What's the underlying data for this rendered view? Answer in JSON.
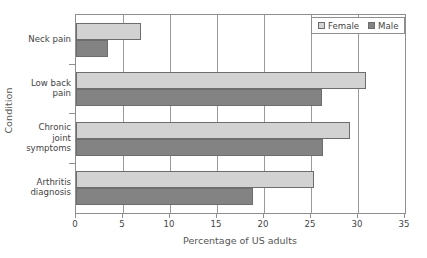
{
  "chart_data": {
    "type": "bar",
    "orientation": "horizontal",
    "title": "",
    "xlabel": "Percentage of US adults",
    "ylabel": "Condition",
    "xlim": [
      0,
      35
    ],
    "xticks": [
      0,
      5,
      10,
      15,
      20,
      25,
      30,
      35
    ],
    "grid": true,
    "legend_position": "top-right",
    "categories": [
      "Neck pain",
      "Low back pain",
      "Chronic joint symptoms",
      "Arthritis diagnosis"
    ],
    "category_lines": [
      [
        "Neck pain"
      ],
      [
        "Low back",
        "pain"
      ],
      [
        "Chronic",
        "joint",
        "symptoms"
      ],
      [
        "Arthritis",
        "diagnosis"
      ]
    ],
    "series": [
      {
        "name": "Female",
        "color": "#d2d2d2",
        "values": [
          6.9,
          30.8,
          29.2,
          25.3
        ]
      },
      {
        "name": "Male",
        "color": "#838383",
        "values": [
          3.4,
          26.2,
          26.3,
          18.8
        ]
      }
    ]
  },
  "legend": {
    "entries": [
      {
        "label": "Female",
        "swatch": "female"
      },
      {
        "label": "Male",
        "swatch": "male"
      }
    ]
  },
  "axes": {
    "x_title": "Percentage of US adults",
    "y_title": "Condition",
    "x_tick_labels": [
      "0",
      "5",
      "10",
      "15",
      "20",
      "25",
      "30",
      "35"
    ]
  },
  "colors": {
    "female_bar": "#d2d2d2",
    "male_bar": "#838383",
    "bar_outline": "#6d6d6d",
    "axis": "#8e8e8e",
    "gridline": "#9a9a9a",
    "text": "#444444",
    "background": "#ffffff"
  }
}
